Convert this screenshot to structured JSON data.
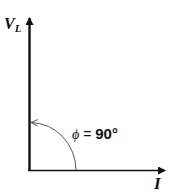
{
  "diagram": {
    "vertical_axis": {
      "label_main": "V",
      "label_sub": "L"
    },
    "horizontal_axis": {
      "label": "I"
    },
    "angle": {
      "symbol": "ϕ",
      "equals": " = ",
      "value": "90°"
    },
    "colors": {
      "line": "#111111",
      "arc": "#444444",
      "background": "#ffffff"
    }
  }
}
